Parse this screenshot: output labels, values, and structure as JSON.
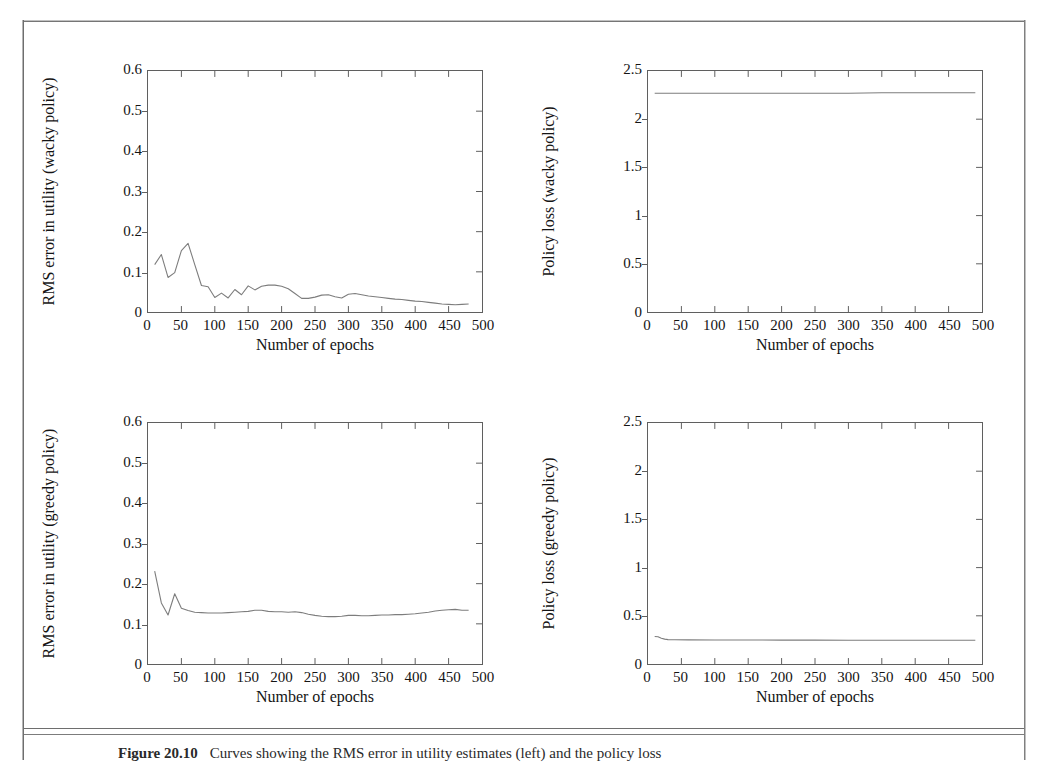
{
  "document": {
    "caption_number": "Figure 20.10",
    "caption_text": "Curves showing the RMS error in utility estimates (left) and the policy loss"
  },
  "axes": {
    "xlabel": "Number of epochs",
    "xticks": [
      "0",
      "50",
      "100",
      "150",
      "200",
      "250",
      "300",
      "350",
      "400",
      "450",
      "500"
    ],
    "xtick_values": [
      0,
      50,
      100,
      150,
      200,
      250,
      300,
      350,
      400,
      450,
      500
    ],
    "rms_yticks": [
      "0",
      "0.1",
      "0.2",
      "0.3",
      "0.4",
      "0.5",
      "0.6"
    ],
    "rms_ytick_values": [
      0,
      0.1,
      0.2,
      0.3,
      0.4,
      0.5,
      0.6
    ],
    "loss_yticks": [
      "0",
      "0.5",
      "1",
      "1.5",
      "2",
      "2.5"
    ],
    "loss_ytick_values": [
      0,
      0.5,
      1,
      1.5,
      2,
      2.5
    ]
  },
  "style": {
    "line_color": "#7d7d7d",
    "frame_color": "#5f5f5f",
    "text_color": "#141414"
  },
  "chart_data": [
    {
      "id": "rms-wacky",
      "type": "line",
      "title": "",
      "xlabel": "Number of epochs",
      "ylabel": "RMS error in utility (wacky policy)",
      "xlim": [
        0,
        500
      ],
      "ylim": [
        0,
        0.6
      ],
      "grid": false,
      "legend": "none",
      "x": [
        10,
        20,
        30,
        40,
        50,
        60,
        70,
        80,
        90,
        100,
        110,
        120,
        130,
        140,
        150,
        160,
        170,
        180,
        190,
        200,
        210,
        220,
        230,
        240,
        250,
        260,
        270,
        280,
        290,
        300,
        310,
        320,
        330,
        340,
        350,
        360,
        370,
        380,
        390,
        400,
        410,
        420,
        430,
        440,
        450,
        460,
        470,
        480
      ],
      "y": [
        0.118,
        0.143,
        0.086,
        0.098,
        0.153,
        0.171,
        0.118,
        0.066,
        0.063,
        0.036,
        0.047,
        0.035,
        0.056,
        0.043,
        0.065,
        0.055,
        0.064,
        0.067,
        0.067,
        0.064,
        0.058,
        0.046,
        0.034,
        0.034,
        0.037,
        0.042,
        0.043,
        0.038,
        0.035,
        0.044,
        0.046,
        0.043,
        0.04,
        0.038,
        0.036,
        0.034,
        0.032,
        0.031,
        0.029,
        0.027,
        0.026,
        0.024,
        0.022,
        0.02,
        0.019,
        0.018,
        0.019,
        0.02
      ]
    },
    {
      "id": "loss-wacky",
      "type": "line",
      "title": "",
      "xlabel": "Number of epochs",
      "ylabel": "Policy loss (wacky policy)",
      "xlim": [
        0,
        500
      ],
      "ylim": [
        0,
        2.5
      ],
      "grid": false,
      "legend": "none",
      "x": [
        10,
        50,
        100,
        150,
        200,
        250,
        300,
        350,
        400,
        450,
        490
      ],
      "y": [
        2.27,
        2.27,
        2.27,
        2.27,
        2.27,
        2.27,
        2.27,
        2.275,
        2.275,
        2.275,
        2.275
      ]
    },
    {
      "id": "rms-greedy",
      "type": "line",
      "title": "",
      "xlabel": "Number of epochs",
      "ylabel": "RMS error in utility (greedy policy)",
      "xlim": [
        0,
        500
      ],
      "ylim": [
        0,
        0.6
      ],
      "grid": false,
      "legend": "none",
      "x": [
        10,
        20,
        30,
        40,
        50,
        60,
        70,
        80,
        90,
        100,
        110,
        120,
        130,
        140,
        150,
        160,
        170,
        180,
        190,
        200,
        210,
        220,
        230,
        240,
        250,
        260,
        270,
        280,
        290,
        300,
        310,
        320,
        330,
        340,
        350,
        360,
        370,
        380,
        390,
        400,
        410,
        420,
        430,
        440,
        450,
        460,
        470,
        480
      ],
      "y": [
        0.231,
        0.152,
        0.122,
        0.175,
        0.139,
        0.133,
        0.129,
        0.128,
        0.127,
        0.127,
        0.127,
        0.128,
        0.129,
        0.13,
        0.131,
        0.134,
        0.134,
        0.131,
        0.13,
        0.13,
        0.129,
        0.13,
        0.128,
        0.124,
        0.121,
        0.119,
        0.118,
        0.118,
        0.119,
        0.121,
        0.121,
        0.12,
        0.12,
        0.121,
        0.122,
        0.122,
        0.123,
        0.123,
        0.124,
        0.125,
        0.127,
        0.129,
        0.132,
        0.134,
        0.135,
        0.136,
        0.134,
        0.134
      ]
    },
    {
      "id": "loss-greedy",
      "type": "line",
      "title": "",
      "xlabel": "Number of epochs",
      "ylabel": "Policy loss (greedy policy)",
      "xlim": [
        0,
        500
      ],
      "ylim": [
        0,
        2.5
      ],
      "grid": false,
      "legend": "none",
      "x": [
        10,
        15,
        20,
        25,
        30,
        40,
        60,
        100,
        150,
        200,
        250,
        300,
        350,
        400,
        450,
        490
      ],
      "y": [
        0.285,
        0.282,
        0.268,
        0.258,
        0.253,
        0.251,
        0.25,
        0.249,
        0.249,
        0.248,
        0.248,
        0.247,
        0.247,
        0.246,
        0.246,
        0.246
      ]
    }
  ]
}
